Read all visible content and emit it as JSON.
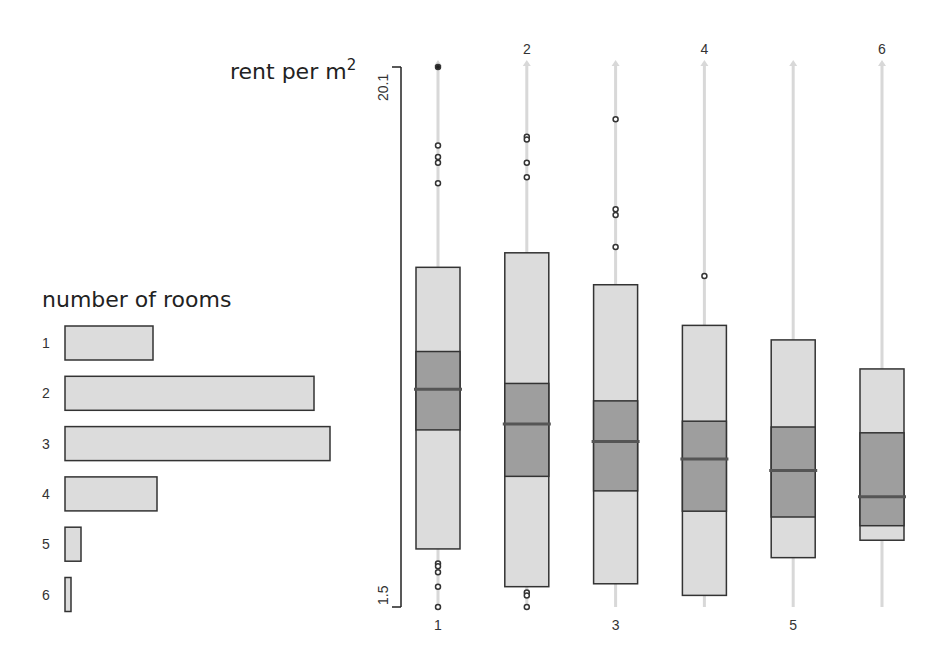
{
  "chart_data": [
    {
      "type": "bar",
      "orientation": "horizontal",
      "title": "number of rooms",
      "categories": [
        "1",
        "2",
        "3",
        "4",
        "5",
        "6"
      ],
      "values": [
        88,
        249,
        265,
        92,
        16,
        6
      ],
      "value_note": "relative counts (bar lengths in px, no axis shown)",
      "xlabel": "",
      "ylabel": "number of rooms",
      "grid": false,
      "colors": {
        "fill": "#dcdcdc",
        "stroke": "#333333"
      }
    },
    {
      "type": "box",
      "title": "rent per m²",
      "ylabel": "rent per m²",
      "ylim": [
        1.5,
        20.1
      ],
      "y_ticks": [
        "1.5",
        "20.1"
      ],
      "categories": [
        "1",
        "2",
        "3",
        "4",
        "5",
        "6"
      ],
      "top_labels": [
        "",
        "2",
        "",
        "4",
        "",
        "6"
      ],
      "bottom_labels": [
        "1",
        "",
        "3",
        "",
        "5",
        ""
      ],
      "grid": false,
      "series": [
        {
          "name": "1",
          "whisker_high": 13.2,
          "q3": 10.3,
          "median": 9.0,
          "q1": 7.6,
          "whisker_low": 3.5,
          "outliers_high": [
            20.1,
            17.4,
            17.0,
            16.8,
            16.1
          ],
          "outliers_low": [
            3.0,
            2.9,
            2.7,
            2.2,
            1.5
          ]
        },
        {
          "name": "2",
          "whisker_high": 13.7,
          "q3": 9.2,
          "median": 7.8,
          "q1": 6.0,
          "whisker_low": 2.2,
          "outliers_high": [
            17.7,
            17.6,
            16.8,
            16.3
          ],
          "outliers_low": [
            2.0,
            1.9,
            1.5
          ]
        },
        {
          "name": "3",
          "whisker_high": 12.6,
          "q3": 8.6,
          "median": 7.2,
          "q1": 5.5,
          "whisker_low": 2.3,
          "outliers_high": [
            18.3,
            15.2,
            15.0,
            13.9
          ],
          "outliers_low": []
        },
        {
          "name": "4",
          "whisker_high": 11.2,
          "q3": 7.9,
          "median": 6.6,
          "q1": 4.8,
          "whisker_low": 1.9,
          "outliers_high": [
            12.9
          ],
          "outliers_low": []
        },
        {
          "name": "5",
          "whisker_high": 10.7,
          "q3": 7.7,
          "median": 6.2,
          "q1": 4.6,
          "whisker_low": 3.2,
          "outliers_high": [],
          "outliers_low": []
        },
        {
          "name": "6",
          "whisker_high": 9.7,
          "q3": 7.5,
          "median": 5.3,
          "q1": 4.3,
          "whisker_low": 3.8,
          "outliers_high": [],
          "outliers_low": []
        }
      ],
      "colors": {
        "box_outer": "#dcdcdc",
        "box_inner": "#9e9e9e",
        "median": "#555555",
        "stroke": "#333333",
        "range_line": "#d8d8d8"
      }
    }
  ],
  "labels": {
    "rooms_title": "number of rooms",
    "rent_title": "rent per m",
    "rent_sup": "2",
    "y_max": "20.1",
    "y_min": "1.5"
  }
}
